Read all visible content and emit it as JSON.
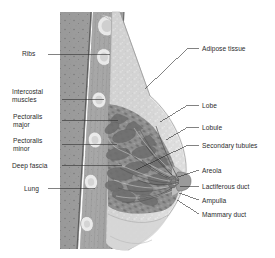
{
  "figure": {
    "style": "grayscale medical illustration",
    "background_color": "#ffffff",
    "label_text_color": "#2b2b2b",
    "leader_line_color": "#2e2e2e"
  },
  "labels_left": [
    {
      "id": "ribs",
      "text": "Ribs",
      "lines": [
        "Ribs"
      ],
      "text_x": 22,
      "text_y": 50,
      "leader": [
        [
          48,
          54
        ],
        [
          110,
          54
        ]
      ]
    },
    {
      "id": "intercostal-muscles",
      "text": "Intercostal muscles",
      "lines": [
        "Intercostal",
        "muscles"
      ],
      "text_x": 12,
      "text_y": 88,
      "leader": [
        [
          62,
          99
        ],
        [
          104,
          99
        ]
      ]
    },
    {
      "id": "pectoralis-major",
      "text": "Pectoralis major",
      "lines": [
        "Pectoralis",
        "major"
      ],
      "text_x": 13,
      "text_y": 113,
      "leader": [
        [
          62,
          120
        ],
        [
          118,
          120
        ]
      ]
    },
    {
      "id": "pectoralis-minor",
      "text": "Pectoralis minor",
      "lines": [
        "Pectoralis",
        "minor"
      ],
      "text_x": 13,
      "text_y": 137,
      "leader": [
        [
          62,
          144
        ],
        [
          117,
          144
        ]
      ]
    },
    {
      "id": "deep-fascia",
      "text": "Deep fascia",
      "lines": [
        "Deep fascia"
      ],
      "text_x": 12,
      "text_y": 162,
      "leader": [
        [
          62,
          165
        ],
        [
          122,
          165
        ]
      ]
    },
    {
      "id": "lung",
      "text": "Lung",
      "lines": [
        "Lung"
      ],
      "text_x": 24,
      "text_y": 185,
      "leader": [
        [
          48,
          188
        ],
        [
          95,
          188
        ]
      ]
    }
  ],
  "labels_right": [
    {
      "id": "adipose-tissue",
      "text": "Adipose tissue",
      "lines": [
        "Adipose tissue"
      ],
      "text_x": 202,
      "text_y": 45,
      "leader": [
        [
          145,
          89
        ],
        [
          188,
          48
        ],
        [
          199,
          48
        ]
      ]
    },
    {
      "id": "lobe",
      "text": "Lobe",
      "lines": [
        "Lobe"
      ],
      "text_x": 202,
      "text_y": 102,
      "leader": [
        [
          160,
          122
        ],
        [
          188,
          105
        ],
        [
          199,
          105
        ]
      ]
    },
    {
      "id": "lobule",
      "text": "Lobule",
      "lines": [
        "Lobule"
      ],
      "text_x": 202,
      "text_y": 124,
      "leader": [
        [
          166,
          140
        ],
        [
          188,
          127
        ],
        [
          199,
          127
        ]
      ]
    },
    {
      "id": "secondary-tubules",
      "text": "Secondary tubules",
      "lines": [
        "Secondary tubules"
      ],
      "text_x": 202,
      "text_y": 142,
      "leader": [
        [
          136,
          170
        ],
        [
          188,
          145
        ],
        [
          199,
          145
        ]
      ]
    },
    {
      "id": "areola",
      "text": "Areola",
      "lines": [
        "Areola"
      ],
      "text_x": 202,
      "text_y": 167,
      "leader": [
        [
          178,
          177
        ],
        [
          199,
          170
        ]
      ]
    },
    {
      "id": "lactiferous-duct",
      "text": "Lactiferous duct",
      "lines": [
        "Lactiferous duct"
      ],
      "text_x": 202,
      "text_y": 183,
      "leader": [
        [
          180,
          186
        ],
        [
          199,
          186
        ]
      ]
    },
    {
      "id": "ampulla",
      "text": "Ampulla",
      "lines": [
        "Ampulla"
      ],
      "text_x": 202,
      "text_y": 197,
      "leader": [
        [
          179,
          193
        ],
        [
          199,
          200
        ]
      ]
    },
    {
      "id": "mammary-duct",
      "text": "Mammary duct",
      "lines": [
        "Mammary duct"
      ],
      "text_x": 202,
      "text_y": 211,
      "leader": [
        [
          177,
          200
        ],
        [
          199,
          214
        ]
      ]
    }
  ]
}
